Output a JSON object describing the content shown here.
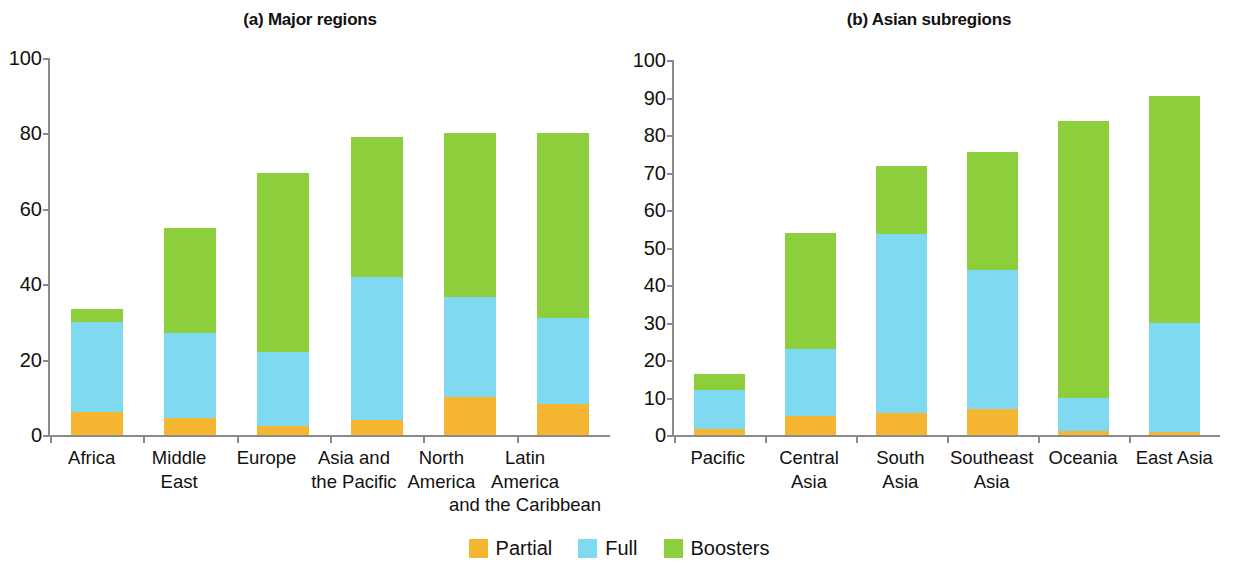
{
  "figure": {
    "panels": [
      {
        "title": "(a) Major regions"
      },
      {
        "title": "(b) Asian subregions"
      }
    ]
  },
  "legend": {
    "items": [
      {
        "label": "Partial",
        "color": "#F5B731"
      },
      {
        "label": "Full",
        "color": "#7FD9F0"
      },
      {
        "label": "Boosters",
        "color": "#8DCE3D"
      }
    ]
  },
  "chart_data": [
    {
      "type": "bar",
      "title": "(a) Major regions",
      "stacked": true,
      "categories": [
        "Africa",
        "Middle East",
        "Europe",
        "Asia and\nthe Pacific",
        "North\nAmerica",
        "Latin\nAmerica\nand the Caribbean"
      ],
      "series": [
        {
          "name": "Partial",
          "color": "#F5B731",
          "values": [
            6,
            4.5,
            2.5,
            4,
            10.2,
            8.3
          ]
        },
        {
          "name": "Full",
          "color": "#7FD9F0",
          "values": [
            24,
            22.5,
            19.5,
            38,
            26.5,
            22.7
          ]
        },
        {
          "name": "Boosters",
          "color": "#8DCE3D",
          "values": [
            3.5,
            28,
            47.5,
            37,
            43.3,
            49
          ]
        }
      ],
      "totals": [
        33.5,
        55,
        69.5,
        79,
        80,
        80
      ],
      "xlabel": "",
      "ylabel": "",
      "ylim": [
        0,
        100
      ],
      "yticks": [
        0,
        20,
        40,
        60,
        80,
        100
      ],
      "grid": false,
      "legend_position": "bottom-center"
    },
    {
      "type": "bar",
      "title": "(b) Asian subregions",
      "stacked": true,
      "categories": [
        "Pacific",
        "Central Asia",
        "South\nAsia",
        "Southeast\nAsia",
        "Oceania",
        "East Asia"
      ],
      "series": [
        {
          "name": "Partial",
          "color": "#F5B731",
          "values": [
            1.5,
            5,
            6,
            7,
            1,
            0.8
          ]
        },
        {
          "name": "Full",
          "color": "#7FD9F0",
          "values": [
            10.5,
            18,
            47.5,
            37,
            9,
            29.2
          ]
        },
        {
          "name": "Boosters",
          "color": "#8DCE3D",
          "values": [
            4.2,
            30.8,
            18.3,
            31.5,
            73.7,
            60.5
          ]
        }
      ],
      "totals": [
        16.2,
        53.8,
        71.8,
        75.5,
        83.7,
        90.5
      ],
      "xlabel": "",
      "ylabel": "",
      "ylim": [
        0,
        100
      ],
      "yticks": [
        0,
        10,
        20,
        30,
        40,
        50,
        60,
        70,
        80,
        90,
        100
      ],
      "grid": false,
      "legend_position": "bottom-center"
    }
  ]
}
